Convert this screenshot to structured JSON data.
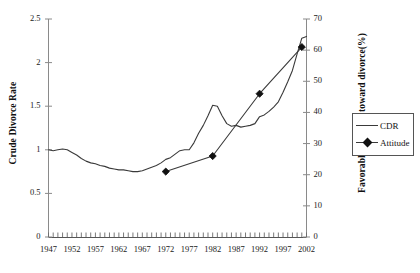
{
  "chart_data": {
    "type": "line",
    "title": "",
    "xlabel": "",
    "grid": false,
    "legend_position": "right",
    "x_axis": {
      "tick_labels": [
        "1947",
        "1952",
        "1957",
        "1962",
        "1967",
        "1972",
        "1977",
        "1982",
        "1987",
        "1992",
        "1997",
        "2002"
      ],
      "minor_tick_interval": 1,
      "range": [
        1947,
        2002
      ]
    },
    "y_axis_left": {
      "label": "Crude Divorce Rate",
      "tick_labels": [
        "0",
        "0.5",
        "1",
        "1.5",
        "2",
        "2.5"
      ],
      "ticks": [
        0,
        0.5,
        1,
        1.5,
        2,
        2.5
      ],
      "ylim": [
        0,
        2.5
      ]
    },
    "y_axis_right": {
      "label": "Favorable Attitude toward divorce(%)",
      "tick_labels": [
        "0",
        "10",
        "20",
        "30",
        "40",
        "50",
        "60",
        "70"
      ],
      "ticks": [
        0,
        10,
        20,
        30,
        40,
        50,
        60,
        70
      ],
      "ylim": [
        0,
        70
      ]
    },
    "series": [
      {
        "name": "CDR",
        "axis": "left",
        "marker": "none",
        "color": "#3a3a3a",
        "x": [
          1947,
          1948,
          1949,
          1950,
          1951,
          1952,
          1953,
          1954,
          1955,
          1956,
          1957,
          1958,
          1959,
          1960,
          1961,
          1962,
          1963,
          1964,
          1965,
          1966,
          1967,
          1968,
          1969,
          1970,
          1971,
          1972,
          1973,
          1974,
          1975,
          1976,
          1977,
          1978,
          1979,
          1980,
          1981,
          1982,
          1983,
          1984,
          1985,
          1986,
          1987,
          1988,
          1989,
          1990,
          1991,
          1992,
          1993,
          1994,
          1995,
          1996,
          1997,
          1998,
          1999,
          2000,
          2001,
          2002
        ],
        "y": [
          1.0,
          0.99,
          1.0,
          1.01,
          1.0,
          0.97,
          0.94,
          0.9,
          0.87,
          0.85,
          0.84,
          0.82,
          0.81,
          0.79,
          0.78,
          0.77,
          0.77,
          0.76,
          0.75,
          0.75,
          0.76,
          0.78,
          0.8,
          0.82,
          0.85,
          0.89,
          0.91,
          0.95,
          0.99,
          1.0,
          1.0,
          1.08,
          1.19,
          1.28,
          1.39,
          1.51,
          1.5,
          1.39,
          1.3,
          1.27,
          1.28,
          1.26,
          1.27,
          1.28,
          1.3,
          1.38,
          1.4,
          1.44,
          1.49,
          1.55,
          1.66,
          1.78,
          1.91,
          2.1,
          2.28,
          2.3
        ]
      },
      {
        "name": "Attitude",
        "axis": "right",
        "marker": "diamond",
        "color": "#3a3a3a",
        "x": [
          1972,
          1982,
          1992,
          2001
        ],
        "y": [
          21,
          26,
          46,
          61
        ]
      }
    ]
  },
  "legend": {
    "items": [
      {
        "label": "CDR",
        "style": "line"
      },
      {
        "label": "Attitude",
        "style": "line-diamond"
      }
    ]
  },
  "colors": {
    "line": "#3a3a3a",
    "marker": "#111111",
    "axis": "#888888",
    "text": "#1a1a1a"
  }
}
